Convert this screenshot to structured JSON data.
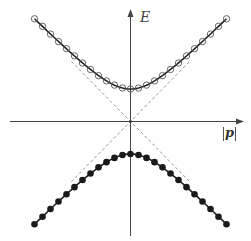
{
  "chart_data": {
    "type": "line",
    "title": "",
    "xlabel": "|p|",
    "ylabel": "E",
    "grid": false,
    "legend": null,
    "mass_gap": 1,
    "x": [
      -3,
      -2.75,
      -2.5,
      -2.25,
      -2,
      -1.75,
      -1.5,
      -1.25,
      -1,
      -0.75,
      -0.5,
      -0.25,
      0,
      0.25,
      0.5,
      0.75,
      1,
      1.25,
      1.5,
      1.75,
      2,
      2.25,
      2.5,
      2.75,
      3
    ],
    "series": [
      {
        "name": "upper band (E = +sqrt(p^2 + m^2))",
        "marker": "open-circle",
        "line": "solid",
        "values": [
          3.16,
          2.93,
          2.69,
          2.46,
          2.24,
          2.02,
          1.8,
          1.6,
          1.41,
          1.25,
          1.12,
          1.03,
          1.0,
          1.03,
          1.12,
          1.25,
          1.41,
          1.6,
          1.8,
          2.02,
          2.24,
          2.46,
          2.69,
          2.93,
          3.16
        ]
      },
      {
        "name": "lower band (E = -sqrt(p^2 + m^2))",
        "marker": "filled-circle",
        "line": "solid",
        "values": [
          -3.16,
          -2.93,
          -2.69,
          -2.46,
          -2.24,
          -2.02,
          -1.8,
          -1.6,
          -1.41,
          -1.25,
          -1.12,
          -1.03,
          -1.0,
          -1.03,
          -1.12,
          -1.25,
          -1.41,
          -1.6,
          -1.8,
          -2.02,
          -2.24,
          -2.46,
          -2.69,
          -2.93,
          -3.16
        ]
      },
      {
        "name": "asymptote E = +|p|",
        "marker": "none",
        "line": "dashed",
        "x": [
          -1.85,
          1.85
        ],
        "values": [
          1.85,
          -1.85
        ]
      },
      {
        "name": "asymptote E = -|p|",
        "marker": "none",
        "line": "dashed",
        "x": [
          -1.85,
          1.85
        ],
        "values": [
          -1.85,
          1.85
        ]
      }
    ],
    "xlim": [
      -3.75,
      3.6
    ],
    "ylim": [
      -3.6,
      3.5
    ]
  },
  "labels": {
    "y_axis": "E",
    "x_axis": "|p|"
  },
  "colors": {
    "curve": "#222222",
    "axis": "#444444",
    "dashed": "#888888",
    "open_marker_stroke": "#555555",
    "filled_marker": "#1a1a1a"
  }
}
